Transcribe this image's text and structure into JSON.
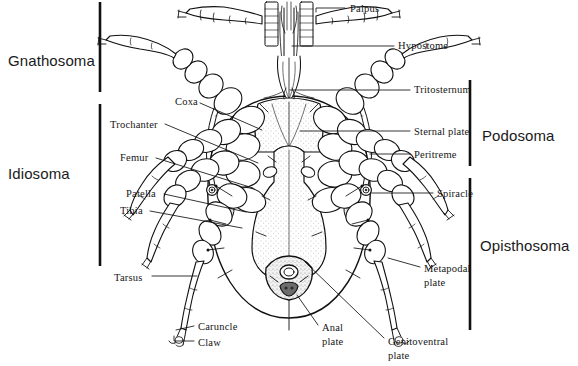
{
  "figure": {
    "title_alt": "Ventral anatomy of a mesostigmatid mite",
    "background_color": "#ffffff",
    "ink_color": "#111111",
    "shade_color": "#dcdcdc",
    "stipple_color": "#9a9a9a"
  },
  "region_labels": [
    {
      "id": "gnathosoma",
      "text": "Gnathosoma",
      "x": 8,
      "y": 52,
      "side": "left"
    },
    {
      "id": "idiosoma",
      "text": "Idiosoma",
      "x": 8,
      "y": 165,
      "side": "left"
    },
    {
      "id": "podosoma",
      "text": "Podosoma",
      "x": 482,
      "y": 127,
      "side": "right"
    },
    {
      "id": "opisthosoma",
      "text": "Opisthosoma",
      "x": 482,
      "y": 237,
      "side": "right"
    }
  ],
  "region_brackets": [
    {
      "id": "bracket-gnathosoma",
      "x": 100,
      "y1": 2,
      "y2": 92,
      "label": "Gnathosoma"
    },
    {
      "id": "bracket-idiosoma",
      "x": 100,
      "y1": 104,
      "y2": 266,
      "label": "Idiosoma"
    },
    {
      "id": "bracket-podosoma",
      "x": 470,
      "y1": 80,
      "y2": 166,
      "label": "Podosoma"
    },
    {
      "id": "bracket-opisthosoma",
      "x": 470,
      "y1": 178,
      "y2": 330,
      "label": "Opisthosoma"
    }
  ],
  "part_labels": [
    {
      "id": "palpus",
      "text": "Palpus",
      "x": 350,
      "y": 3,
      "align": "left"
    },
    {
      "id": "hypostome",
      "text": "Hypostome",
      "x": 398,
      "y": 40,
      "align": "left"
    },
    {
      "id": "tritosternum",
      "text": "Tritosternum",
      "x": 414,
      "y": 84,
      "align": "left"
    },
    {
      "id": "sternal-plate",
      "text": "Sternal plate",
      "x": 414,
      "y": 126,
      "align": "left"
    },
    {
      "id": "peritreme",
      "text": "Peritreme",
      "x": 414,
      "y": 149,
      "align": "left"
    },
    {
      "id": "spiracle",
      "text": "Spiracle",
      "x": 437,
      "y": 188,
      "align": "left"
    },
    {
      "id": "metapodal-plate",
      "text": "Metapodal\nplate",
      "x": 424,
      "y": 262,
      "align": "left",
      "multiline": true
    },
    {
      "id": "genitoventral-plate",
      "text": "Genitoventral\nplate",
      "x": 388,
      "y": 335,
      "align": "left",
      "multiline": true
    },
    {
      "id": "anal-plate",
      "text": "Anal\nplate",
      "x": 322,
      "y": 321,
      "align": "left",
      "multiline": true
    },
    {
      "id": "coxa",
      "text": "Coxa",
      "x": 175,
      "y": 96,
      "align": "left"
    },
    {
      "id": "trochanter",
      "text": "Trochanter",
      "x": 110,
      "y": 119,
      "align": "left"
    },
    {
      "id": "femur",
      "text": "Femur",
      "x": 120,
      "y": 152,
      "align": "left"
    },
    {
      "id": "patella",
      "text": "Patella",
      "x": 126,
      "y": 188,
      "align": "left"
    },
    {
      "id": "tibia",
      "text": "Tibia",
      "x": 120,
      "y": 205,
      "align": "left"
    },
    {
      "id": "tarsus",
      "text": "Tarsus",
      "x": 114,
      "y": 272,
      "align": "left"
    },
    {
      "id": "caruncle",
      "text": "Caruncle",
      "x": 198,
      "y": 321,
      "align": "left"
    },
    {
      "id": "claw",
      "text": "Claw",
      "x": 198,
      "y": 337,
      "align": "left"
    }
  ],
  "leader_lines": [
    {
      "id": "leader-palpus",
      "points": "345,8 316,8 316,12"
    },
    {
      "id": "leader-hypostome",
      "points": "394,46 292,46"
    },
    {
      "id": "leader-tritosternum",
      "points": "410,90 290,90"
    },
    {
      "id": "leader-sternal-plate",
      "points": "410,131 300,131"
    },
    {
      "id": "leader-peritreme",
      "points": "410,154 370,154"
    },
    {
      "id": "leader-spiracle",
      "points": "433,193 371,193"
    },
    {
      "id": "leader-metapodal",
      "points": "420,267 388,258"
    },
    {
      "id": "leader-genitoventral",
      "points": "384,338 305,262"
    },
    {
      "id": "leader-anal",
      "points": "318,325 297,295"
    },
    {
      "id": "leader-coxa",
      "points": "200,103 262,130"
    },
    {
      "id": "leader-trochanter",
      "points": "165,124 258,163"
    },
    {
      "id": "leader-femur",
      "points": "156,158 253,188"
    },
    {
      "id": "leader-patella",
      "points": "164,194 246,212"
    },
    {
      "id": "leader-tibia",
      "points": "150,211 242,228"
    },
    {
      "id": "leader-tarsus",
      "points": "152,276 197,276"
    },
    {
      "id": "leader-caruncle",
      "points": "194,326 176,330"
    },
    {
      "id": "leader-claw",
      "points": "194,341 174,341 174,336"
    }
  ],
  "anatomy_parts": [
    "palpus",
    "hypostome",
    "tritosternum",
    "sternal-plate",
    "peritreme",
    "spiracle",
    "metapodal-plate",
    "genitoventral-plate",
    "anal-plate",
    "coxa",
    "trochanter",
    "femur",
    "patella",
    "tibia",
    "tarsus",
    "caruncle",
    "claw"
  ]
}
